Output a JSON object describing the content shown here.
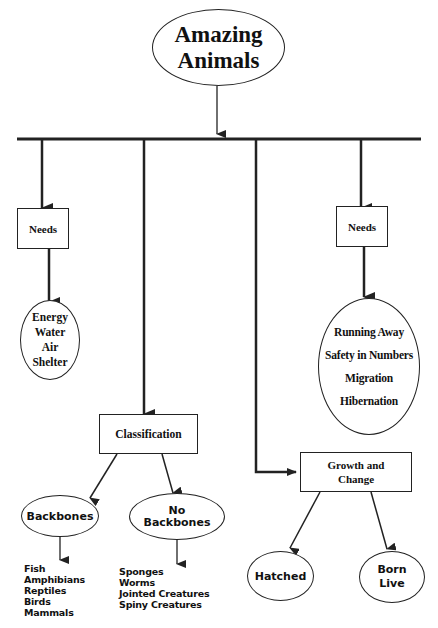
{
  "diagram": {
    "title": {
      "line1": "Amazing",
      "line2": "Animals"
    },
    "needs_left": {
      "label": "Needs",
      "items": [
        "Energy",
        "Water",
        "Air",
        "Shelter"
      ]
    },
    "needs_right": {
      "label": "Needs",
      "items": [
        "Running Away",
        "Safety in Numbers",
        "Migration",
        "Hibernation"
      ]
    },
    "classification": {
      "label": "Classification",
      "backbones": {
        "label": "Backbones",
        "items": [
          "Fish",
          "Amphibians",
          "Reptiles",
          "Birds",
          "Mammals"
        ]
      },
      "no_backbones": {
        "label_line1": "No",
        "label_line2": "Backbones",
        "items": [
          "Sponges",
          "Worms",
          "Jointed Creatures",
          "Spiny Creatures"
        ]
      }
    },
    "growth": {
      "label_line1": "Growth and",
      "label_line2": "Change",
      "hatched": "Hatched",
      "born_live": {
        "line1": "Born",
        "line2": "Live"
      }
    },
    "colors": {
      "line": "#222222",
      "background": "#ffffff",
      "text": "#111111"
    }
  }
}
